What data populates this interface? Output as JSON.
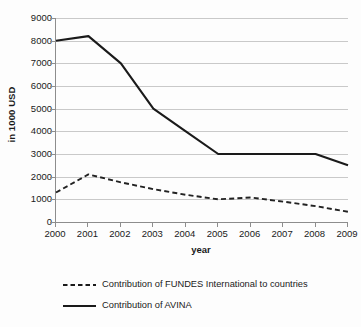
{
  "chart_data": {
    "type": "line",
    "title": "",
    "xlabel": "year",
    "ylabel": "in 1000 USD",
    "categories": [
      "2000",
      "2001",
      "2002",
      "2003",
      "2004",
      "2005",
      "2006",
      "2007",
      "2008",
      "2009"
    ],
    "x": [
      2000,
      2001,
      2002,
      2003,
      2004,
      2005,
      2006,
      2007,
      2008,
      2009
    ],
    "ylim": [
      0,
      9000
    ],
    "ytick_labels": [
      "0",
      "1000",
      "2000",
      "3000",
      "4000",
      "5000",
      "6000",
      "7000",
      "8000",
      "9000"
    ],
    "ytick_values": [
      0,
      1000,
      2000,
      3000,
      4000,
      5000,
      6000,
      7000,
      8000,
      9000
    ],
    "grid": true,
    "legend_position": "bottom-left",
    "series": [
      {
        "name": "Contribution of FUNDES International to countries",
        "style": "dashed",
        "color": "#222222",
        "values": [
          1300,
          2100,
          1750,
          1450,
          1200,
          1000,
          1080,
          900,
          700,
          450
        ]
      },
      {
        "name": "Contribution of AVINA",
        "style": "solid",
        "color": "#1a1a1a",
        "values": [
          8000,
          8200,
          7000,
          5000,
          4000,
          3000,
          3000,
          3000,
          3000,
          2500
        ]
      }
    ]
  },
  "legend": {
    "items": [
      {
        "label": "Contribution of FUNDES International to countries",
        "style": "dashed"
      },
      {
        "label": "Contribution of AVINA",
        "style": "solid"
      }
    ]
  }
}
